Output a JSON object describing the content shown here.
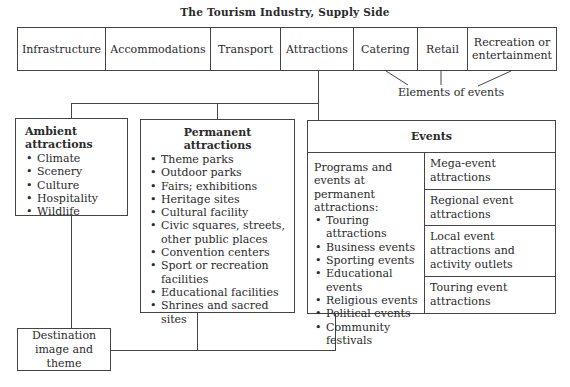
{
  "title": "The Tourism Industry, Supply Side",
  "supply_sectors": [
    {
      "label": "Infrastructure",
      "width": 88
    },
    {
      "label": "Accommodations",
      "width": 105
    },
    {
      "label": "Transport",
      "width": 70
    },
    {
      "label": "Attractions",
      "width": 73
    },
    {
      "label": "Catering",
      "width": 64
    },
    {
      "label": "Retail",
      "width": 50
    },
    {
      "label": "Recreation or entertainment",
      "width": 90
    }
  ],
  "elements_of_events_label": "Elements of events",
  "ambient": {
    "title": "Ambient attractions",
    "items": [
      "Climate",
      "Scenery",
      "Culture",
      "Hospitality",
      "Wildlife"
    ]
  },
  "permanent": {
    "title": "Permanent attractions",
    "items": [
      "Theme parks",
      "Outdoor parks",
      "Fairs; exhibitions",
      "Heritage sites",
      "Cultural facility",
      "Civic squares, streets, other public places",
      "Convention centers",
      "Sport or recreation facilities",
      "Educational facilities",
      "Shrines and sacred sites"
    ]
  },
  "events": {
    "title": "Events",
    "left_intro": "Programs and events at permanent attractions:",
    "left_items": [
      "Touring attractions",
      "Business events",
      "Sporting events",
      "Educational events",
      "Religious events",
      "Political events",
      "Community festivals"
    ],
    "right_cells": [
      "Mega-event attractions",
      "Regional event attractions",
      "Local event attractions and activity outlets",
      "Touring event attractions"
    ]
  },
  "destination": {
    "label": "Destination image and theme"
  },
  "colors": {
    "line": "#444444",
    "text": "#2a2a2a",
    "background": "#ffffff"
  }
}
